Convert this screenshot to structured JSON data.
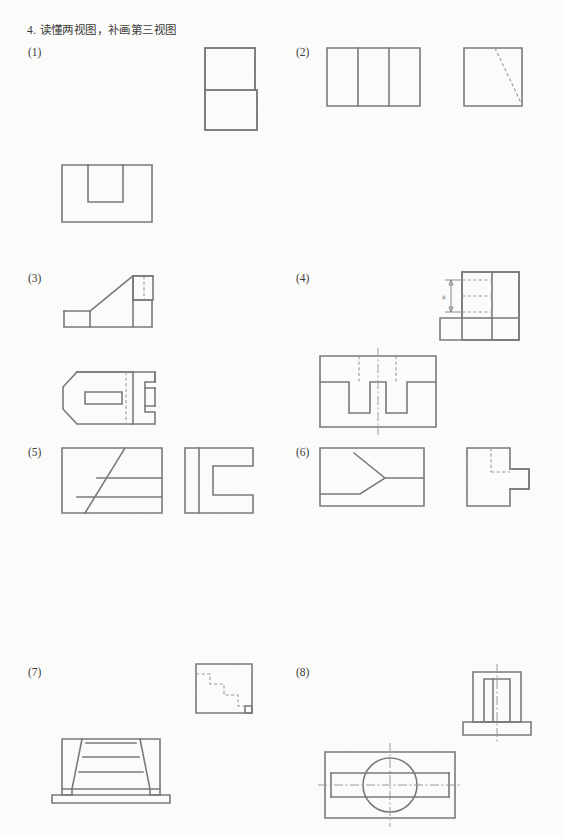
{
  "page": {
    "title": "4. 读懂两视图，补画第三视图",
    "background_color": "#fbfbfa",
    "line_color": "#7a7a7a",
    "hidden_line_color": "#9a9a9a",
    "width": 563,
    "height": 836
  },
  "problems": [
    {
      "id": "1",
      "label": "(1)",
      "views": [
        {
          "name": "front-view",
          "description": "L-shaped outline: narrow upper block stacked on wider lower block",
          "kind": "solid-outline"
        },
        {
          "name": "top-view",
          "description": "rectangle containing a smaller open-bottom rectangle notch at upper middle",
          "kind": "solid-outline"
        }
      ]
    },
    {
      "id": "2",
      "label": "(2)",
      "views": [
        {
          "name": "front-view",
          "description": "rectangle divided by two vertical lines into three panels",
          "kind": "solid-outline"
        },
        {
          "name": "side-view",
          "description": "square with a dashed diagonal from top edge to bottom-right corner",
          "kind": "solid-outline-with-hidden-diagonal"
        }
      ]
    },
    {
      "id": "3",
      "label": "(3)",
      "views": [
        {
          "name": "front-view",
          "description": "stepped profile with inclined face rising from low left base to upper right platform",
          "kind": "solid-outline"
        },
        {
          "name": "top-view",
          "description": "chamfered-left outline with rectangular slot and hidden centerline",
          "kind": "solid-outline-with-hidden-line"
        }
      ]
    },
    {
      "id": "4",
      "label": "(4)",
      "views": [
        {
          "name": "front-view",
          "description": "L-shaped block with diameter dimension on upper portion",
          "kind": "solid-outline-with-dimension",
          "dimension": "ϕ"
        },
        {
          "name": "top-view",
          "description": "rectangle with two rectangular slots cut from the middle, dashed lines and vertical centerline",
          "kind": "solid-outline-with-hidden-lines"
        }
      ]
    },
    {
      "id": "5",
      "label": "(5)",
      "views": [
        {
          "name": "front-view",
          "description": "rectangle crossed by an inclined line and two horizontal lines",
          "kind": "solid-outline"
        },
        {
          "name": "top-view",
          "description": "C-shaped profile with vertical line near left edge",
          "kind": "solid-outline"
        }
      ]
    },
    {
      "id": "6",
      "label": "(6)",
      "views": [
        {
          "name": "front-view",
          "description": "rectangle containing a wedge converging to a point at mid-right",
          "kind": "solid-outline"
        },
        {
          "name": "side-view",
          "description": "stepped square with small block at right and dashed hidden lines",
          "kind": "solid-outline-with-hidden-lines"
        }
      ]
    },
    {
      "id": "7",
      "label": "(7)",
      "views": [
        {
          "name": "side-view",
          "description": "square with descending dashed staircase and small notch at lower right",
          "kind": "solid-outline-with-hidden-staircase"
        },
        {
          "name": "front-view",
          "description": "trapezoidal stepped pyramid shape on a base with feet",
          "kind": "solid-outline"
        }
      ]
    },
    {
      "id": "8",
      "label": "(8)",
      "views": [
        {
          "name": "side-view",
          "description": "T-shaped block with inner rectangle and vertical centerline",
          "kind": "solid-outline-with-centerline"
        },
        {
          "name": "top-view",
          "description": "rectangle with central circle, horizontal through-slot and crossing centerlines",
          "kind": "solid-outline-with-centerlines"
        }
      ]
    }
  ]
}
